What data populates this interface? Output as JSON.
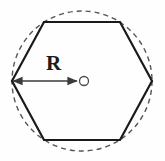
{
  "figure": {
    "name": "regular-hexagon-inscribed-in-circle",
    "background_color": "#fefefe",
    "labels": {
      "radius_label": "R"
    },
    "colors": {
      "hexagon_stroke": "#1a1a1a",
      "circle_stroke": "#555555",
      "arrow_stroke": "#3a3a3a",
      "center_dot_stroke": "#4a4a4a",
      "label_color": "#1a1a1a",
      "background": "#fefefe"
    },
    "geometry": {
      "center_x": 82,
      "center_y": 81,
      "circumradius": 70,
      "hexagon_vertices": [
        {
          "x": 12,
          "y": 81
        },
        {
          "x": 44,
          "y": 22
        },
        {
          "x": 120,
          "y": 22
        },
        {
          "x": 152,
          "y": 81
        },
        {
          "x": 120,
          "y": 140
        },
        {
          "x": 44,
          "y": 140
        }
      ],
      "center_dot_radius": 4.5,
      "arrow_start": {
        "x": 13,
        "y": 81
      },
      "arrow_end": {
        "x": 77,
        "y": 81
      },
      "hexagon_stroke_width": 2.2,
      "circle_stroke_width": 1.4,
      "circle_dash_pattern": "5,4",
      "arrow_stroke_width": 1.6
    }
  }
}
